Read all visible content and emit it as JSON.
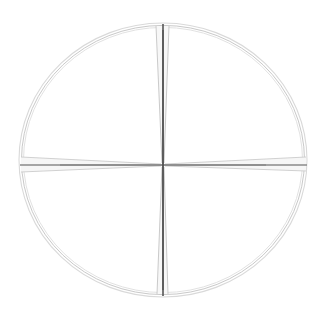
{
  "canvas": {
    "width": 325,
    "height": 316,
    "background_color": "#ffffff",
    "title": "Circular crosshair reticle"
  },
  "colors": {
    "background": "#ffffff",
    "ring_outer": "#d9d9d9",
    "ring_middle": "#c9c9c9",
    "ring_inner": "#dedede",
    "vertical_hair_core": "#555555",
    "vertical_hair_edge": "#c4c4c4",
    "horizontal_hair_core": "#8a8a8a",
    "horizontal_hair_edge": "#cccccc",
    "wedge_fill": "#f2f2f2"
  },
  "chart_data": {
    "type": "diagram",
    "subtitle": "",
    "xlabel": "",
    "ylabel": "",
    "grid": false,
    "legend": "none",
    "elements": [
      {
        "name": "outer-ring-arc",
        "shape": "ellipse",
        "cx": 163,
        "cy": 160,
        "rx": 144,
        "ry": 137,
        "stroke": "#d9d9d9",
        "stroke_width": 1.1,
        "fill": "none"
      },
      {
        "name": "middle-ring-arc",
        "shape": "ellipse",
        "cx": 163,
        "cy": 160,
        "rx": 141.5,
        "ry": 134.6,
        "stroke": "#c9c9c9",
        "stroke_width": 1.0,
        "fill": "none"
      },
      {
        "name": "inner-ring-arc",
        "shape": "ellipse",
        "cx": 163,
        "cy": 160,
        "rx": 139.5,
        "ry": 132.6,
        "stroke": "#dedede",
        "stroke_width": 0.9,
        "fill": "none"
      },
      {
        "name": "vertical-crosshair-core",
        "shape": "line",
        "x1": 163,
        "y1": 24,
        "x2": 163,
        "y2": 296,
        "stroke": "#555555",
        "stroke_width": 1.6
      },
      {
        "name": "horizontal-crosshair-core",
        "shape": "line",
        "x1": 20,
        "y1": 165,
        "x2": 307,
        "y2": 165,
        "stroke": "#8a8a8a",
        "stroke_width": 1.3
      },
      {
        "name": "vertical-wedge-upper-left",
        "shape": "line",
        "x1": 156,
        "y1": 26,
        "x2": 162,
        "y2": 163,
        "stroke": "#c4c4c4",
        "stroke_width": 0.9
      },
      {
        "name": "vertical-wedge-upper-right",
        "shape": "line",
        "x1": 169,
        "y1": 26,
        "x2": 164,
        "y2": 163,
        "stroke": "#c4c4c4",
        "stroke_width": 0.9
      },
      {
        "name": "vertical-wedge-lower-left",
        "shape": "line",
        "x1": 162,
        "y1": 167,
        "x2": 157,
        "y2": 294,
        "stroke": "#c4c4c4",
        "stroke_width": 0.9
      },
      {
        "name": "vertical-wedge-lower-right",
        "shape": "line",
        "x1": 164,
        "y1": 167,
        "x2": 168,
        "y2": 294,
        "stroke": "#c4c4c4",
        "stroke_width": 0.9
      },
      {
        "name": "horizontal-wedge-left-upper",
        "shape": "line",
        "x1": 21,
        "y1": 157,
        "x2": 161,
        "y2": 164,
        "stroke": "#cccccc",
        "stroke_width": 0.9
      },
      {
        "name": "horizontal-wedge-left-lower",
        "shape": "line",
        "x1": 21,
        "y1": 172,
        "x2": 161,
        "y2": 166,
        "stroke": "#cccccc",
        "stroke_width": 0.9
      },
      {
        "name": "horizontal-wedge-right-upper",
        "shape": "line",
        "x1": 306,
        "y1": 157,
        "x2": 165,
        "y2": 164,
        "stroke": "#cccccc",
        "stroke_width": 0.9
      },
      {
        "name": "horizontal-wedge-right-lower",
        "shape": "line",
        "x1": 306,
        "y1": 171,
        "x2": 165,
        "y2": 166,
        "stroke": "#cccccc",
        "stroke_width": 0.9
      }
    ],
    "center_point": {
      "x": 163,
      "y": 165
    },
    "annotations": []
  }
}
